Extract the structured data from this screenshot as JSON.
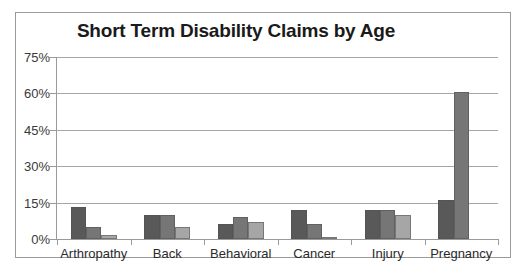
{
  "chart_data": {
    "type": "bar",
    "title": "Short Term Disability Claims by Age",
    "xlabel": "",
    "ylabel": "",
    "ylim": [
      0,
      75
    ],
    "ytick_labels": [
      "0%",
      "15%",
      "30%",
      "45%",
      "60%",
      "75%"
    ],
    "ytick_values": [
      0,
      15,
      30,
      45,
      60,
      75
    ],
    "grid": true,
    "legend": "none",
    "categories": [
      "Arthropathy",
      "Back",
      "Behavioral",
      "Cancer",
      "Injury",
      "Pregnancy"
    ],
    "series": [
      {
        "name": "Series 1",
        "color": "#595959",
        "values": [
          13,
          10,
          6,
          12,
          12,
          16
        ]
      },
      {
        "name": "Series 2",
        "color": "#767676",
        "values": [
          5,
          10,
          9,
          6,
          12,
          60.5
        ]
      },
      {
        "name": "Series 3",
        "color": "#a6a6a6",
        "values": [
          1.5,
          5,
          7,
          1,
          10,
          0
        ]
      }
    ]
  },
  "colors": {
    "series_1": "#595959",
    "series_2": "#767676",
    "series_3": "#a6a6a6",
    "gridline": "#a6a6a6",
    "axis": "#9a9a9a",
    "frame_border": "#9a9a9a",
    "title_text": "#1a1a1a",
    "tick_text": "#3a3a3a"
  }
}
